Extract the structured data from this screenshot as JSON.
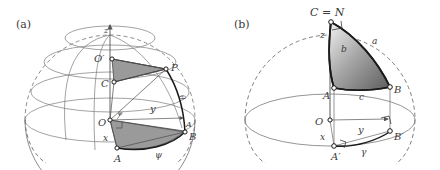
{
  "figure": {
    "type": "geometry-diagram",
    "background": "#ffffff",
    "line_color": "#6f6f6f",
    "bold_line_color": "#1a1a1a",
    "label_color": "#3a3a3a",
    "shade_flat": "#9a9a9a",
    "shade_grad_light": "#f2f2f2",
    "shade_grad_dark": "#5c5c5c"
  },
  "panels": [
    {
      "id": "a",
      "tag": "(a)",
      "labels": [
        {
          "key": "z_axis",
          "text": "z"
        },
        {
          "key": "O_prime",
          "text": "O′"
        },
        {
          "key": "C",
          "text": "C"
        },
        {
          "key": "P",
          "text": "P"
        },
        {
          "key": "O",
          "text": "O"
        },
        {
          "key": "A",
          "text": "A"
        },
        {
          "key": "B",
          "text": "B"
        },
        {
          "key": "y_axis",
          "text": "y"
        },
        {
          "key": "x_axis",
          "text": "x"
        },
        {
          "key": "psi",
          "text": "ψ"
        },
        {
          "key": "phi",
          "text": "φ"
        },
        {
          "key": "theta",
          "text": "θ"
        },
        {
          "key": "A_right",
          "text": "A"
        }
      ]
    },
    {
      "id": "b",
      "tag": "(b)",
      "labels": [
        {
          "key": "CN",
          "text": "C = N"
        },
        {
          "key": "z_axis",
          "text": "z"
        },
        {
          "key": "side_b",
          "text": "b"
        },
        {
          "key": "side_a",
          "text": "a"
        },
        {
          "key": "A",
          "text": "A"
        },
        {
          "key": "side_c",
          "text": "c"
        },
        {
          "key": "B",
          "text": "B"
        },
        {
          "key": "O",
          "text": "O"
        },
        {
          "key": "y_axis",
          "text": "y"
        },
        {
          "key": "x_axis",
          "text": "x"
        },
        {
          "key": "A_prime",
          "text": "A′"
        },
        {
          "key": "B_prime",
          "text": "B′"
        },
        {
          "key": "gamma",
          "text": "γ"
        }
      ]
    }
  ]
}
